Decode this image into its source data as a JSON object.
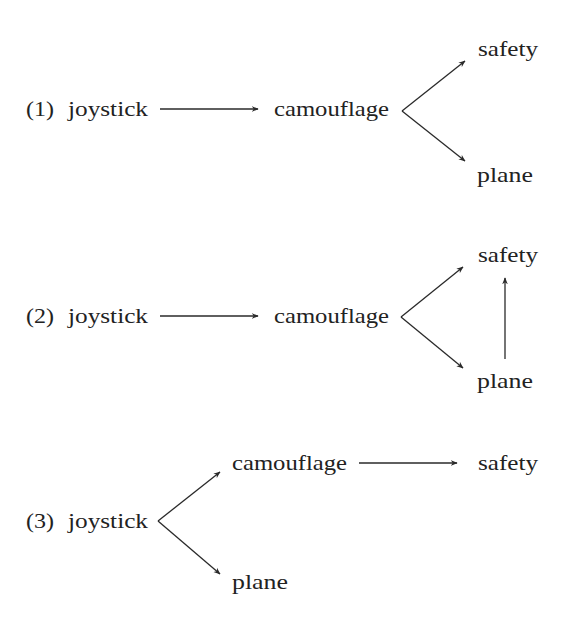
{
  "colors": {
    "text": "#222222",
    "line": "#2a2a2a",
    "background": "#ffffff"
  },
  "diagrams": [
    {
      "number": "(1)",
      "nodes": {
        "joystick": "joystick",
        "camouflage": "camouflage",
        "safety": "safety",
        "plane": "plane"
      },
      "edges": [
        [
          "joystick",
          "camouflage"
        ],
        [
          "camouflage",
          "safety"
        ],
        [
          "camouflage",
          "plane"
        ]
      ]
    },
    {
      "number": "(2)",
      "nodes": {
        "joystick": "joystick",
        "camouflage": "camouflage",
        "safety": "safety",
        "plane": "plane"
      },
      "edges": [
        [
          "joystick",
          "camouflage"
        ],
        [
          "camouflage",
          "safety"
        ],
        [
          "camouflage",
          "plane"
        ],
        [
          "plane",
          "safety"
        ]
      ]
    },
    {
      "number": "(3)",
      "nodes": {
        "joystick": "joystick",
        "camouflage": "camouflage",
        "safety": "safety",
        "plane": "plane"
      },
      "edges": [
        [
          "joystick",
          "camouflage"
        ],
        [
          "joystick",
          "plane"
        ],
        [
          "camouflage",
          "safety"
        ]
      ]
    }
  ]
}
